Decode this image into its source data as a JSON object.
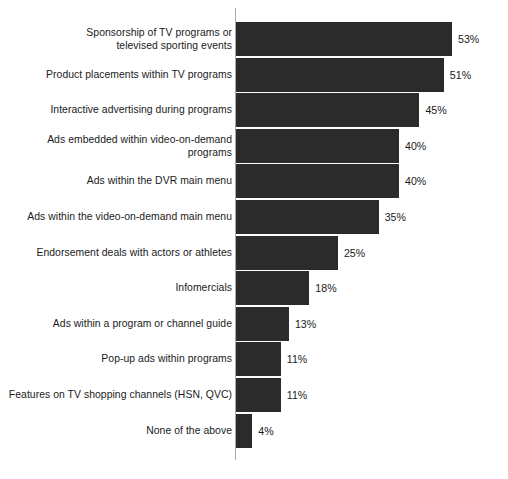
{
  "chart_data": {
    "type": "bar",
    "orientation": "horizontal",
    "title": "",
    "subtitle": "",
    "xlabel": "",
    "ylabel": "",
    "xlim": [
      0,
      53
    ],
    "grid": false,
    "legend": false,
    "value_suffix": "%",
    "bar_color": "#2b2b2b",
    "axis_color": "#a9a9a9",
    "text_color": "#1a1a1a",
    "categories": [
      "Sponsorship of TV programs or\ntelevised sporting events",
      "Product placements within TV programs",
      "Interactive advertising during programs",
      "Ads embedded within video-on-demand\nprograms",
      "Ads within the DVR main menu",
      "Ads within the video-on-demand main menu",
      "Endorsement deals with actors or athletes",
      "Infomercials",
      "Ads within a program or channel guide",
      "Pop-up ads within programs",
      "Features on TV shopping channels (HSN, QVC)",
      "None of the above"
    ],
    "values": [
      53,
      51,
      45,
      40,
      40,
      35,
      25,
      18,
      13,
      11,
      11,
      4
    ],
    "value_labels": [
      "53%",
      "51%",
      "45%",
      "40%",
      "40%",
      "35%",
      "25%",
      "18%",
      "13%",
      "11%",
      "11%",
      "4%"
    ]
  }
}
